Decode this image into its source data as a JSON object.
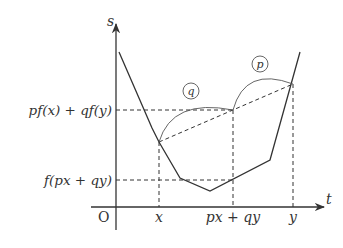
{
  "axes": {
    "y_label": "s",
    "x_label": "t",
    "origin_label": "O"
  },
  "y_ticks": [
    {
      "label": "pf(x) + qf(y)"
    },
    {
      "label": "f(px + qy)"
    }
  ],
  "x_ticks": [
    {
      "label": "x"
    },
    {
      "label": "px + qy"
    },
    {
      "label": "y"
    }
  ],
  "arc_labels": {
    "left": "q",
    "right": "p"
  },
  "colors": {
    "ink": "#333333"
  }
}
